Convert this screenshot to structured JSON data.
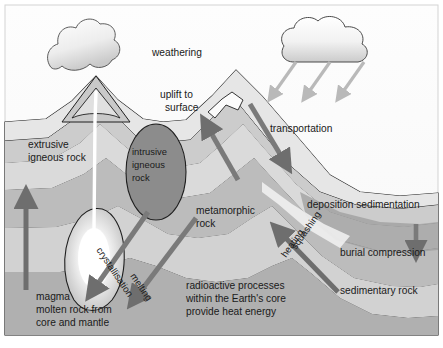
{
  "diagram": {
    "background_color": "#fdfdfd",
    "frame_color": "#cfcfcf"
  },
  "labels": {
    "weathering": "weathering",
    "uplift_line1": "uplift to",
    "uplift_line2": "surface",
    "transportation": "transportation",
    "extrusive_line1": "extrusive",
    "extrusive_line2": "igneous rock",
    "intrusive_line1": "intrusive",
    "intrusive_line2": "igneous",
    "intrusive_line3": "rock",
    "metamorphic_line1": "metamorphic",
    "metamorphic_line2": "rock",
    "deposition": "deposition sedimentation",
    "burial": "burial compression",
    "sedimentary": "sedimentary rock",
    "crystallisation": "crystallisation",
    "melting": "melting",
    "squashing": "squashing",
    "heating": "heating",
    "magma_line1": "magma",
    "magma_line2": "molten rock from",
    "magma_line3": "core and mantle",
    "core_line1": "radioactive processes",
    "core_line2": "within the Earth's core",
    "core_line3": "provide heat energy"
  },
  "icons": {
    "cloud": "cloud-icon",
    "volcano": "volcano-icon",
    "smoke": "smoke-plume-icon",
    "magma_chamber": "magma-chamber-icon",
    "rain_arrow": "rain-arrow-icon",
    "transport_arrow": "transport-arrow-icon",
    "uplift_arrow": "uplift-arrow-icon",
    "extrusive_arrow": "extrusive-arrow-icon",
    "burial_arrow": "burial-arrow-icon",
    "crystallisation_arrow": "crystallisation-arrow-icon",
    "melting_arrow": "melting-arrow-icon",
    "squashing_arrow": "squashing-arrow-icon"
  },
  "colors": {
    "arrow_dark": "#6e6e6e",
    "arrow_light": "#b9b9b9",
    "stratum_lightest": "#e6e6e6",
    "stratum_light": "#d6d6d6",
    "stratum_mid": "#c2c2c2",
    "stratum_dark": "#a8a8a8",
    "stratum_darkest": "#8e8e8e",
    "intrusive_fill": "#8a8a8a",
    "outline": "#1f1f1f",
    "magma_core": "#ffffff"
  }
}
